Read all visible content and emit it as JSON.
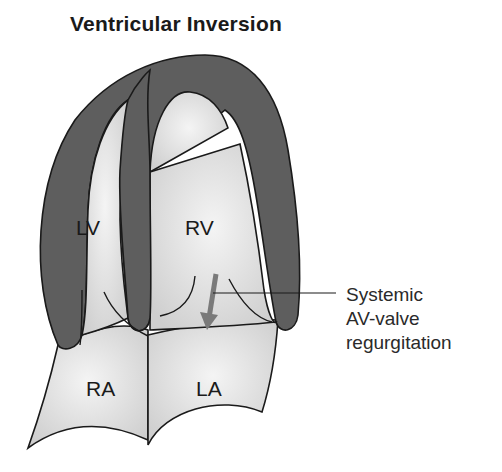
{
  "title": "Ventricular Inversion",
  "labels": {
    "lv": "LV",
    "rv": "RV",
    "ra": "RA",
    "la": "LA"
  },
  "annotation": {
    "line1": "Systemic",
    "line2": "AV-valve",
    "line3": "regurgitation"
  },
  "colors": {
    "myocardium": "#5e5e5e",
    "chamber": "#e6e6e6",
    "outline": "#1a1a1a",
    "arrow": "#7a7a7a"
  }
}
